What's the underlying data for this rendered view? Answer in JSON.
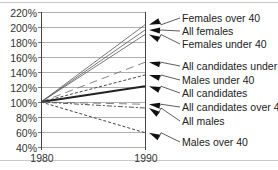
{
  "chart_data": {
    "type": "line",
    "title": "",
    "xlabel": "",
    "ylabel": "",
    "x": [
      "1980",
      "1990"
    ],
    "yticks": [
      "40%",
      "60%",
      "80%",
      "100%",
      "120%",
      "140%",
      "160%",
      "180%",
      "200%",
      "220%"
    ],
    "ylim": [
      40,
      220
    ],
    "grid": true,
    "legend_position": "right (arrow-annotated labels)",
    "series": [
      {
        "name": "Females over 40",
        "values": [
          100,
          203
        ],
        "style": "solid-thin"
      },
      {
        "name": "All females",
        "values": [
          100,
          196
        ],
        "style": "solid-thin"
      },
      {
        "name": "Females under 40",
        "values": [
          100,
          190
        ],
        "style": "solid-thin"
      },
      {
        "name": "All candidates under 40",
        "values": [
          100,
          153
        ],
        "style": "long-dash"
      },
      {
        "name": "Males under 40",
        "values": [
          100,
          136
        ],
        "style": "short-dash"
      },
      {
        "name": "All candidates",
        "values": [
          100,
          121
        ],
        "style": "solid-thick"
      },
      {
        "name": "All candidates over 40",
        "values": [
          100,
          97
        ],
        "style": "long-dash"
      },
      {
        "name": "All males",
        "values": [
          100,
          92
        ],
        "style": "dash-dot"
      },
      {
        "name": "Males over 40",
        "values": [
          100,
          59
        ],
        "style": "short-dash"
      }
    ],
    "legend_label_y": [
      18,
      31,
      44,
      66,
      80,
      93,
      107,
      121,
      142
    ]
  }
}
